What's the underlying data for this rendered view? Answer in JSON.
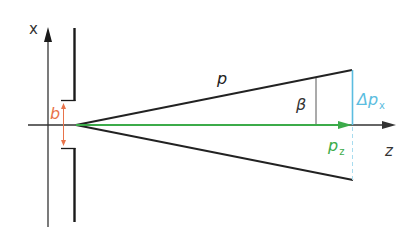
{
  "figure": {
    "type": "single-slit momentum uncertainty diagram",
    "labels": {
      "x_axis": "x",
      "z_axis": "z",
      "slit_width": "b",
      "momentum": "p",
      "angle": "β",
      "delta_p_x": "Δp",
      "delta_p_x_sub": "x",
      "p_z": "p",
      "p_z_sub": "z"
    },
    "colors": {
      "axis": "#333333",
      "wall": "#1a1a1a",
      "ray": "#222222",
      "slit_width": "#e8734a",
      "p_z": "#3cab4a",
      "delta_p_x": "#5bbde0",
      "label_dark": "#222222"
    }
  }
}
